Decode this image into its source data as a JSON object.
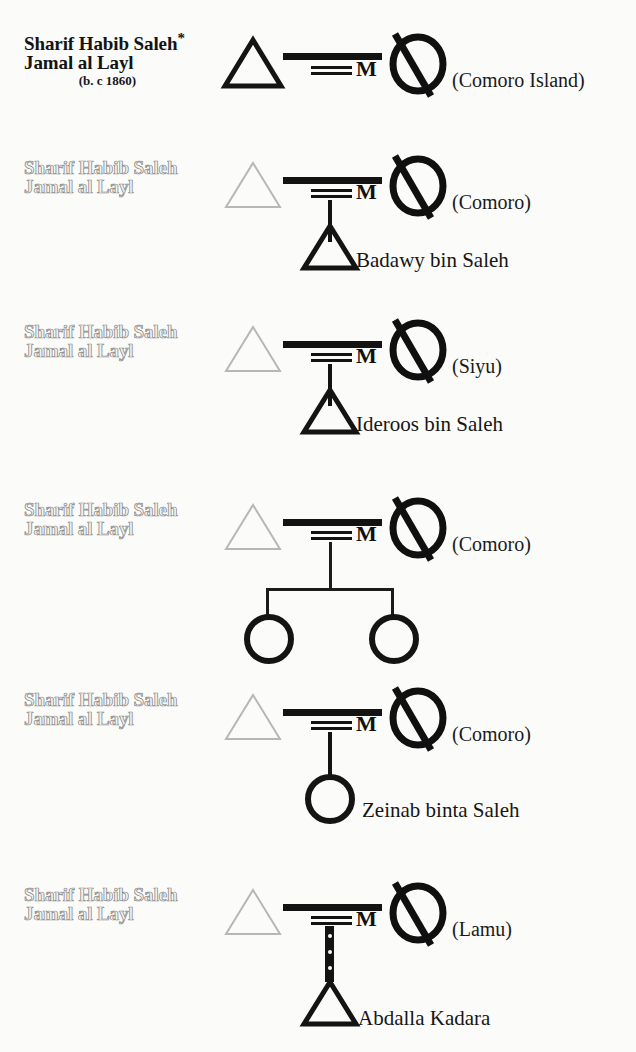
{
  "diagram": {
    "type": "genealogy-pedigree-chart",
    "symbol_legend": {
      "triangle": "male",
      "circle": "female",
      "circle-with-slash": "deceased female",
      "equals-M": "married",
      "dotted-descent": "non-biological or uncertain descent"
    },
    "ink_color": "#131313",
    "ghost_color": "#9a9a9a",
    "paper_color": "#fbfbf9"
  },
  "rows": [
    {
      "id": "union-1",
      "father_line1": "Sharif Habib Saleh",
      "father_star": "*",
      "father_line2": "Jamal al Layl",
      "father_birth": "(b.  c 1860)",
      "marriage_label": "M",
      "wife_place": "(Comoro Island)",
      "children": []
    },
    {
      "id": "union-2",
      "father_line1": "Sharif Habib Saleh",
      "father_line2": "Jamal al Layl",
      "marriage_label": "M",
      "wife_place": "(Comoro)",
      "children": [
        {
          "name": "Badawy bin Saleh",
          "sex": "male",
          "descent": "solid"
        }
      ]
    },
    {
      "id": "union-3",
      "father_line1": "Sharif Habib Saleh",
      "father_line2": "Jamal al Layl",
      "marriage_label": "M",
      "wife_place": "(Siyu)",
      "children": [
        {
          "name": "Ideroos bin Saleh",
          "sex": "male",
          "descent": "solid"
        }
      ]
    },
    {
      "id": "union-4",
      "father_line1": "Sharif Habib Saleh",
      "father_line2": "Jamal al Layl",
      "marriage_label": "M",
      "wife_place": "(Comoro)",
      "children": [
        {
          "name": "",
          "sex": "female",
          "descent": "solid"
        },
        {
          "name": "",
          "sex": "female",
          "descent": "solid"
        }
      ]
    },
    {
      "id": "union-5",
      "father_line1": "Sharif Habib Saleh",
      "father_line2": "Jamal al Layl",
      "marriage_label": "M",
      "wife_place": "(Comoro)",
      "children": [
        {
          "name": "Zeinab binta Saleh",
          "sex": "female",
          "descent": "solid"
        }
      ]
    },
    {
      "id": "union-6",
      "father_line1": "Sharif Habib Saleh",
      "father_line2": "Jamal al Layl",
      "marriage_label": "M",
      "wife_place": "(Lamu)",
      "children": [
        {
          "name": "Abdalla Kadara",
          "sex": "male",
          "descent": "dotted"
        }
      ]
    }
  ]
}
